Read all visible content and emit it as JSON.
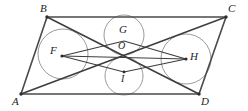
{
  "figure": {
    "type": "geometry-diagram",
    "canvas": {
      "width": 248,
      "height": 111
    },
    "stroke_colors": {
      "edge": "#4a4a4a",
      "diagonal": "#3d3d3d",
      "rhombus": "#3d3d3d",
      "circle": "#9a9a9a",
      "vertex_dot": "#2e2e2e",
      "background": "#ffffff",
      "label": "#1d1d1d"
    },
    "points": [
      {
        "name": "A",
        "label": "A",
        "x": 21,
        "y": 94,
        "label_x": 12,
        "label_y": 96,
        "dot": true
      },
      {
        "name": "B",
        "label": "B",
        "x": 47,
        "y": 17,
        "label_x": 40,
        "label_y": 3,
        "dot": true
      },
      {
        "name": "C",
        "label": "C",
        "x": 226,
        "y": 17,
        "label_x": 228,
        "label_y": 3,
        "dot": true
      },
      {
        "name": "D",
        "label": "D",
        "x": 199,
        "y": 94,
        "label_x": 201,
        "label_y": 96,
        "dot": true
      },
      {
        "name": "F",
        "label": "F",
        "x": 62,
        "y": 56,
        "label_x": 50,
        "label_y": 45,
        "dot": true
      },
      {
        "name": "G",
        "label": "G",
        "x": 124,
        "y": 41,
        "label_x": 119,
        "label_y": 24,
        "dot": false
      },
      {
        "name": "H",
        "label": "H",
        "x": 186,
        "y": 59,
        "label_x": 190,
        "label_y": 51,
        "dot": true
      },
      {
        "name": "I",
        "label": "I",
        "x": 124,
        "y": 72,
        "label_x": 121,
        "label_y": 74,
        "dot": true
      },
      {
        "name": "O",
        "label": "O",
        "x": 124,
        "y": 56,
        "label_x": 118,
        "label_y": 41,
        "dot": false
      }
    ],
    "segments": [
      {
        "name": "side-AB",
        "from": "A",
        "to": "B",
        "kind": "edge"
      },
      {
        "name": "side-BC",
        "from": "B",
        "to": "C",
        "kind": "edge"
      },
      {
        "name": "side-CD",
        "from": "C",
        "to": "D",
        "kind": "edge"
      },
      {
        "name": "side-DA",
        "from": "D",
        "to": "A",
        "kind": "edge"
      },
      {
        "name": "diagonal-AC",
        "from": "A",
        "to": "C",
        "kind": "diagonal"
      },
      {
        "name": "diagonal-BD",
        "from": "B",
        "to": "D",
        "kind": "diagonal"
      },
      {
        "name": "rhombus-FG",
        "from": "F",
        "to": "G",
        "kind": "rhombus"
      },
      {
        "name": "rhombus-GH",
        "from": "G",
        "to": "H",
        "kind": "rhombus"
      },
      {
        "name": "rhombus-HI",
        "from": "H",
        "to": "I",
        "kind": "rhombus"
      },
      {
        "name": "rhombus-IF",
        "from": "I",
        "to": "F",
        "kind": "rhombus"
      },
      {
        "name": "axis-FH",
        "from": "F",
        "to": "H",
        "kind": "rhombus"
      }
    ],
    "circles": [
      {
        "name": "circle-F",
        "cx": 63,
        "cy": 54,
        "r": 25
      },
      {
        "name": "circle-H",
        "cx": 186,
        "cy": 59,
        "r": 25
      },
      {
        "name": "circle-G",
        "cx": 124,
        "cy": 35,
        "r": 20
      },
      {
        "name": "circle-I",
        "cx": 124,
        "cy": 76,
        "r": 19
      }
    ]
  }
}
